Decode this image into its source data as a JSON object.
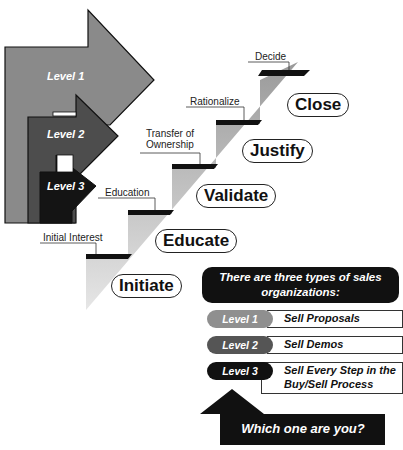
{
  "levels_graphic": {
    "arrows": [
      {
        "label": "Level 1",
        "color": "#8a8a8a"
      },
      {
        "label": "Level 2",
        "color": "#4d4d4d"
      },
      {
        "label": "Level 3",
        "color": "#141414"
      }
    ]
  },
  "staircase": {
    "step_labels": [
      "Initial Interest",
      "Education",
      "Transfer of Ownership",
      "Rationalize",
      "Decide"
    ],
    "transfer_line1": "Transfer of",
    "transfer_line2": "Ownership",
    "stages": [
      "Initiate",
      "Educate",
      "Validate",
      "Justify",
      "Close"
    ]
  },
  "legend": {
    "header": "There are three types of sales organizations:",
    "rows": [
      {
        "level": "Level 1",
        "description": "Sell Proposals",
        "color": "#8f8f8f"
      },
      {
        "level": "Level 2",
        "description": "Sell Demos",
        "color": "#555555"
      },
      {
        "level": "Level 3",
        "description": "Sell Every Step in the Buy/Sell Process",
        "color": "#111111"
      }
    ]
  },
  "callout": {
    "question": "Which one are you?"
  }
}
